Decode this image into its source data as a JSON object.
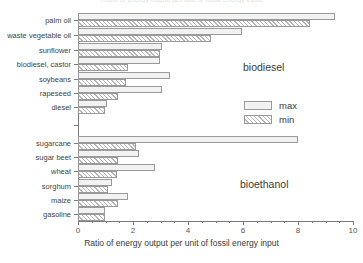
{
  "chart_data": {
    "type": "bar",
    "orientation": "horizontal",
    "title": "Ratio of energy output per unit of fossil energy input",
    "xlabel": "Ratio of energy output per unit of fossil energy input",
    "ylabel": "",
    "xlim": [
      0,
      10
    ],
    "xticks": [
      0,
      2,
      4,
      6,
      8,
      10
    ],
    "xticklabels": [
      "0",
      "2",
      "4",
      "6",
      "8",
      "10"
    ],
    "grid": false,
    "legend_position": "center-right",
    "categories": [
      "palm oil",
      "waste vegetable oil",
      "sunflower",
      "biodiesel, castor",
      "soybeans",
      "rapeseed",
      "diesel",
      "sugarcane",
      "sugar beet",
      "wheat",
      "sorghum",
      "maize",
      "gasoline"
    ],
    "series": [
      {
        "name": "max",
        "values": [
          9.35,
          5.95,
          3.05,
          2.98,
          3.35,
          3.05,
          1.05,
          8.0,
          2.2,
          2.8,
          1.25,
          1.8,
          0.98
        ]
      },
      {
        "name": "min",
        "values": [
          8.45,
          4.85,
          2.98,
          1.8,
          1.75,
          1.45,
          0.98,
          2.1,
          1.45,
          1.4,
          1.1,
          1.45,
          0.98
        ]
      }
    ],
    "annotations": [
      {
        "text": "biodiesel",
        "group": "upper"
      },
      {
        "text": "bioethanol",
        "group": "lower"
      }
    ]
  },
  "legend": {
    "entries": [
      {
        "label": "max",
        "style": "solid-light"
      },
      {
        "label": "min",
        "style": "hatched"
      }
    ]
  },
  "colors": {
    "max_fill": "#f2f2f2",
    "min_hatch": "#b8b8b8",
    "bar_border": "#9a9a9a",
    "axis": "#7a7a7a",
    "text": "#3a3a3a"
  }
}
